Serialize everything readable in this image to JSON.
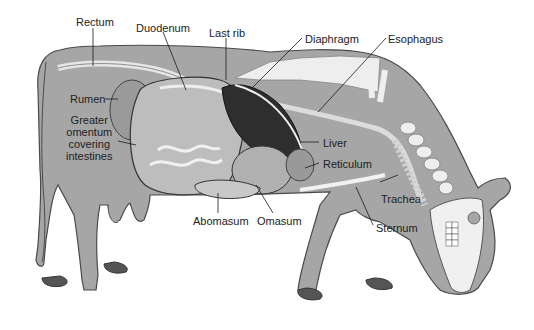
{
  "colors": {
    "body": "#a6a6a6",
    "body_outline": "#4a4a4a",
    "bone": "#eeeeee",
    "liver": "#2e2e2e",
    "rumen_texture": "#bdbdbd",
    "hoof": "#555555",
    "label_text": "#222222",
    "leader_line": "#1a1a1a"
  },
  "labels": {
    "rectum": "Rectum",
    "duodenum": "Duodenum",
    "last_rib": "Last rib",
    "diaphragm": "Diaphragm",
    "esophagus": "Esophagus",
    "rumen": "Rumen",
    "greater_omentum": [
      "Greater",
      "omentum",
      "covering",
      "intestines"
    ],
    "liver": "Liver",
    "reticulum": "Reticulum",
    "trachea": "Trachea",
    "sternum": "Sternum",
    "abomasum": "Abomasum",
    "omasum": "Omasum"
  }
}
